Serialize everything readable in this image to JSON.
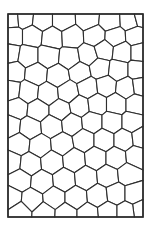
{
  "figure": {
    "type": "voronoi-cell-tessellation",
    "frame": {
      "x": 8,
      "y": 14,
      "width": 135,
      "height": 203
    },
    "colors": {
      "background": "#ffffff",
      "cell_fill": "#ffffff",
      "edge": "#2e2e2e",
      "frame": "#2a2a2a"
    },
    "seeds": [
      [
        12,
        19
      ],
      [
        24,
        18
      ],
      [
        42,
        20
      ],
      [
        63,
        20
      ],
      [
        88,
        19
      ],
      [
        110,
        21
      ],
      [
        130,
        20
      ],
      [
        141,
        17
      ],
      [
        13,
        36
      ],
      [
        32,
        36
      ],
      [
        52,
        38
      ],
      [
        72,
        37
      ],
      [
        95,
        36
      ],
      [
        115,
        37
      ],
      [
        136,
        36
      ],
      [
        10,
        53
      ],
      [
        28,
        56
      ],
      [
        48,
        56
      ],
      [
        70,
        58
      ],
      [
        88,
        55
      ],
      [
        104,
        50
      ],
      [
        122,
        52
      ],
      [
        140,
        52
      ],
      [
        14,
        72
      ],
      [
        36,
        74
      ],
      [
        58,
        76
      ],
      [
        80,
        72
      ],
      [
        100,
        68
      ],
      [
        118,
        70
      ],
      [
        138,
        70
      ],
      [
        11,
        90
      ],
      [
        28,
        92
      ],
      [
        48,
        94
      ],
      [
        68,
        92
      ],
      [
        88,
        88
      ],
      [
        106,
        86
      ],
      [
        126,
        88
      ],
      [
        141,
        86
      ],
      [
        17,
        108
      ],
      [
        38,
        110
      ],
      [
        60,
        110
      ],
      [
        80,
        106
      ],
      [
        97,
        104
      ],
      [
        116,
        104
      ],
      [
        136,
        104
      ],
      [
        10,
        126
      ],
      [
        30,
        128
      ],
      [
        52,
        126
      ],
      [
        72,
        124
      ],
      [
        92,
        122
      ],
      [
        112,
        122
      ],
      [
        132,
        122
      ],
      [
        19,
        144
      ],
      [
        40,
        146
      ],
      [
        62,
        144
      ],
      [
        84,
        140
      ],
      [
        104,
        140
      ],
      [
        124,
        140
      ],
      [
        141,
        138
      ],
      [
        11,
        162
      ],
      [
        30,
        164
      ],
      [
        52,
        162
      ],
      [
        74,
        160
      ],
      [
        96,
        158
      ],
      [
        116,
        158
      ],
      [
        136,
        156
      ],
      [
        20,
        180
      ],
      [
        42,
        182
      ],
      [
        64,
        180
      ],
      [
        86,
        178
      ],
      [
        108,
        176
      ],
      [
        128,
        174
      ],
      [
        11,
        198
      ],
      [
        32,
        200
      ],
      [
        54,
        198
      ],
      [
        76,
        198
      ],
      [
        98,
        196
      ],
      [
        116,
        194
      ],
      [
        134,
        194
      ],
      [
        141,
        210
      ],
      [
        20,
        212
      ],
      [
        44,
        213
      ],
      [
        66,
        214
      ],
      [
        88,
        214
      ],
      [
        108,
        212
      ],
      [
        126,
        212
      ]
    ]
  }
}
